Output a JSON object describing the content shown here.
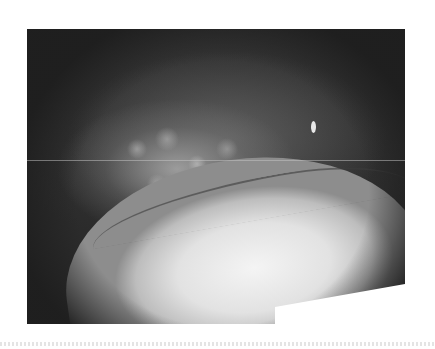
{
  "image": {
    "description": "Grayscale endoscopic view of mucosal tissue: darker upper fold with cobblestone texture, brightly lit lower tissue mass, dark vignette corners",
    "colors": {
      "background": "#ffffff",
      "dark_field": "#2b2b2b",
      "bright_tissue": "#f4f4f4",
      "mid_tissue": "#8d8d8d"
    }
  }
}
